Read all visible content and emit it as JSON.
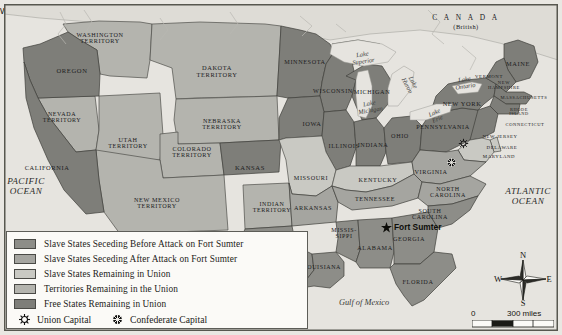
{
  "colors": {
    "seceded_before": "#8d8d88",
    "seceded_after": "#a5a5a0",
    "slave_in_union": "#c9c9c3",
    "territory": "#b4b4ae",
    "free_state": "#7e7e79",
    "water": "#e6e4df",
    "border": "#4f4f4a",
    "frame": "#57574f"
  },
  "legend": {
    "items": [
      {
        "label": "Slave States Seceding Before Attack on Fort Sumter",
        "swatch": "#8d8d88"
      },
      {
        "label": "Slave States Seceding After Attack on Fort Sumter",
        "swatch": "#a5a5a0"
      },
      {
        "label": "Slave States Remaining in Union",
        "swatch": "#c9c9c3"
      },
      {
        "label": "Territories Remaining in the Union",
        "swatch": "#b4b4ae"
      },
      {
        "label": "Free States Remaining in Union",
        "swatch": "#7e7e79"
      }
    ],
    "union_capital_label": "Union Capital",
    "confederate_capital_label": "Confederate Capital"
  },
  "compass": {
    "n": "N",
    "e": "E",
    "s": "S",
    "w": "W"
  },
  "scale": {
    "zero": "0",
    "max": "300 miles"
  },
  "markers": {
    "fort_sumter": "Fort Sumter",
    "washington_dc": "Washington, D.C.",
    "richmond": "Richmond"
  },
  "countries": [
    {
      "name": "C A N A D A",
      "sub": "(British)",
      "x": 466,
      "y": 22
    }
  ],
  "oceans": [
    {
      "name": "PACIFIC\nOCEAN",
      "x": 26,
      "y": 186
    },
    {
      "name": "ATLANTIC\nOCEAN",
      "x": 528,
      "y": 196
    },
    {
      "name": "Gulf of Mexico",
      "x": 364,
      "y": 303
    }
  ],
  "lakes": [
    {
      "name": "Lake\nSuperior",
      "x": 363,
      "y": 58,
      "rot": -8
    },
    {
      "name": "Lake\nHuron",
      "x": 410,
      "y": 84,
      "rot": 62
    },
    {
      "name": "Lake\nMichigan",
      "x": 370,
      "y": 107,
      "rot": -10
    },
    {
      "name": "Lake\nErie",
      "x": 436,
      "y": 116,
      "rot": -25
    },
    {
      "name": "Lake\nOntario",
      "x": 465,
      "y": 83,
      "rot": -8
    }
  ],
  "states": [
    {
      "name": "WASHINGTON\nTERRITORY",
      "x": 100,
      "y": 38,
      "size": 6.2,
      "cat": "territory"
    },
    {
      "name": "OREGON",
      "x": 72,
      "y": 71,
      "size": 6.6,
      "cat": "free"
    },
    {
      "name": "NEVADA\nTERRITORY",
      "x": 62,
      "y": 117,
      "size": 6.0,
      "cat": "territory"
    },
    {
      "name": "CALIFORNIA",
      "x": 47,
      "y": 168,
      "size": 6.4,
      "cat": "free"
    },
    {
      "name": "UTAH\nTERRITORY",
      "x": 128,
      "y": 143,
      "size": 6.2,
      "cat": "territory"
    },
    {
      "name": "DAKOTA\nTERRITORY",
      "x": 217,
      "y": 72,
      "size": 6.4,
      "cat": "territory"
    },
    {
      "name": "NEBRASKA\nTERRITORY",
      "x": 222,
      "y": 124,
      "size": 6.2,
      "cat": "territory"
    },
    {
      "name": "COLORADO\nTERRITORY",
      "x": 192,
      "y": 152,
      "size": 6.2,
      "cat": "territory"
    },
    {
      "name": "NEW MEXICO\nTERRITORY",
      "x": 157,
      "y": 203,
      "size": 6.2,
      "cat": "territory"
    },
    {
      "name": "KANSAS",
      "x": 250,
      "y": 168,
      "size": 6.6,
      "cat": "free"
    },
    {
      "name": "INDIAN\nTERRITORY",
      "x": 272,
      "y": 207,
      "size": 6.0,
      "cat": "territory"
    },
    {
      "name": "TEXAS",
      "x": 287,
      "y": 265,
      "size": 6.6,
      "cat": "before"
    },
    {
      "name": "MINNESOTA",
      "x": 305,
      "y": 62,
      "size": 6.2,
      "cat": "free"
    },
    {
      "name": "WISCONSIN",
      "x": 333,
      "y": 91,
      "size": 6.2,
      "cat": "free"
    },
    {
      "name": "IOWA",
      "x": 312,
      "y": 124,
      "size": 6.4,
      "cat": "free"
    },
    {
      "name": "MISSOURI",
      "x": 311,
      "y": 178,
      "size": 6.2,
      "cat": "slave-union"
    },
    {
      "name": "ARKANSAS",
      "x": 313,
      "y": 208,
      "size": 6.2,
      "cat": "after"
    },
    {
      "name": "LOUISIANA",
      "x": 322,
      "y": 267,
      "size": 6.0,
      "cat": "before"
    },
    {
      "name": "MISSIS-\nSIPPI",
      "x": 344,
      "y": 233,
      "size": 6.0,
      "cat": "before"
    },
    {
      "name": "ILLINOIS",
      "x": 344,
      "y": 146,
      "size": 6.2,
      "cat": "free"
    },
    {
      "name": "MICHIGAN",
      "x": 372,
      "y": 92,
      "size": 6.2,
      "cat": "free"
    },
    {
      "name": "INDIANA",
      "x": 373,
      "y": 145,
      "size": 6.2,
      "cat": "free"
    },
    {
      "name": "OHIO",
      "x": 400,
      "y": 136,
      "size": 6.2,
      "cat": "free"
    },
    {
      "name": "KENTUCKY",
      "x": 378,
      "y": 180,
      "size": 6.2,
      "cat": "slave-union"
    },
    {
      "name": "TENNESSEE",
      "x": 375,
      "y": 199,
      "size": 6.2,
      "cat": "after"
    },
    {
      "name": "ALABAMA",
      "x": 375,
      "y": 248,
      "size": 6.2,
      "cat": "before"
    },
    {
      "name": "GEORGIA",
      "x": 409,
      "y": 239,
      "size": 6.2,
      "cat": "before"
    },
    {
      "name": "FLORIDA",
      "x": 418,
      "y": 282,
      "size": 6.2,
      "cat": "before"
    },
    {
      "name": "SOUTH\nCAROLINA",
      "x": 430,
      "y": 214,
      "size": 6.0,
      "cat": "before"
    },
    {
      "name": "NORTH\nCAROLINA",
      "x": 448,
      "y": 192,
      "size": 6.0,
      "cat": "after"
    },
    {
      "name": "VIRGINIA",
      "x": 431,
      "y": 172,
      "size": 6.2,
      "cat": "after"
    },
    {
      "name": "PENNSYLVANIA",
      "x": 443,
      "y": 127,
      "size": 6.2,
      "cat": "free"
    },
    {
      "name": "NEW YORK",
      "x": 462,
      "y": 104,
      "size": 6.4,
      "cat": "free"
    },
    {
      "name": "MAINE",
      "x": 518,
      "y": 64,
      "size": 6.4,
      "cat": "free"
    },
    {
      "name": "VERMONT",
      "x": 489,
      "y": 77,
      "size": 4.8,
      "cat": "free"
    },
    {
      "name": "NEW\nHAMPSHIRE",
      "x": 504,
      "y": 86,
      "size": 4.6,
      "cat": "free"
    },
    {
      "name": "MASSACHUSETTS",
      "x": 524,
      "y": 98,
      "size": 4.6,
      "cat": "free"
    },
    {
      "name": "RHODE\nISLAND",
      "x": 519,
      "y": 112,
      "size": 4.4,
      "cat": "free"
    },
    {
      "name": "CONNECTICUT",
      "x": 525,
      "y": 125,
      "size": 4.6,
      "cat": "free"
    },
    {
      "name": "NEW JERSEY",
      "x": 500,
      "y": 137,
      "size": 4.8,
      "cat": "free"
    },
    {
      "name": "DELAWARE",
      "x": 502,
      "y": 148,
      "size": 4.8,
      "cat": "slave-union"
    },
    {
      "name": "MARYLAND",
      "x": 499,
      "y": 157,
      "size": 4.8,
      "cat": "slave-union"
    }
  ]
}
